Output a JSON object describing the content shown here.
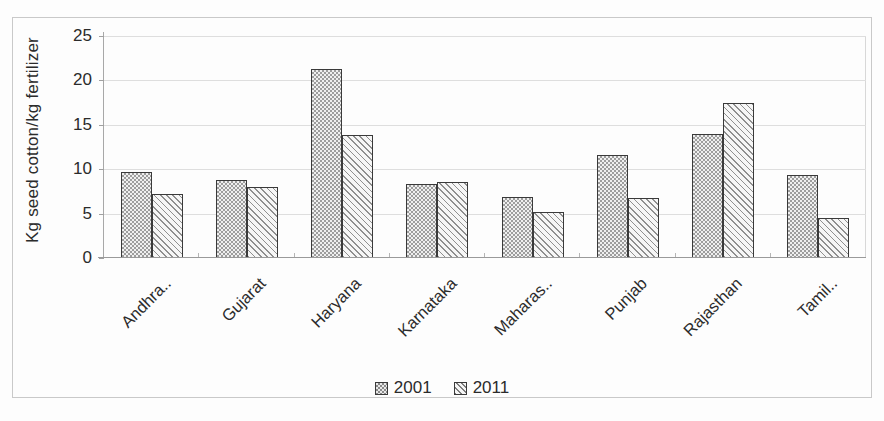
{
  "chart_data": {
    "type": "bar",
    "title": "",
    "subtitle": "",
    "xlabel": "",
    "ylabel": "Kg seed cotton/kg fertilizer",
    "ylim": [
      0,
      25
    ],
    "yticks": [
      0,
      5,
      10,
      15,
      20,
      25
    ],
    "grid": true,
    "legend_position": "bottom-center",
    "categories": [
      "Andhra..",
      "Gujarat",
      "Haryana",
      "Karnataka",
      "Maharas..",
      "Punjab",
      "Rajasthan",
      "Tamil.."
    ],
    "series": [
      {
        "name": "2001",
        "pattern": "dotted",
        "color": "#9d9d9d",
        "values": [
          9.7,
          8.8,
          21.3,
          8.3,
          6.9,
          11.6,
          14.0,
          9.3
        ]
      },
      {
        "name": "2011",
        "pattern": "diagonal-hatch",
        "color": "#f2f2f2",
        "values": [
          7.2,
          8.0,
          13.8,
          8.6,
          5.2,
          6.8,
          17.5,
          4.5
        ]
      }
    ]
  },
  "axis": {
    "y_title": "Kg seed cotton/kg fertilizer",
    "tick_labels": [
      "25",
      "20",
      "15",
      "10",
      "5",
      "0"
    ]
  },
  "legend": {
    "items": [
      {
        "label": "2001"
      },
      {
        "label": "2011"
      }
    ]
  },
  "colors": {
    "series_2001": "#9d9d9d",
    "series_2011": "#f2f2f2",
    "bar_outline": "#3a3a3a",
    "gridline": "#dedede",
    "frame": "#c9c9c9",
    "text": "#2b2b2b"
  }
}
